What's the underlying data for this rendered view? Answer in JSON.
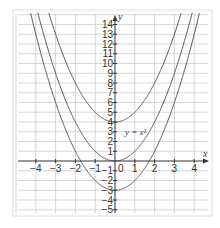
{
  "chart_data": {
    "type": "line",
    "title": "",
    "xlabel": "x",
    "ylabel": "y",
    "xlim": [
      -5,
      4.7
    ],
    "ylim": [
      -5.5,
      15
    ],
    "grid": true,
    "x_ticks": [
      -4,
      -3,
      -2,
      -1,
      0,
      1,
      2,
      3,
      4
    ],
    "y_ticks": [
      -5,
      -4,
      -3,
      -2,
      -1,
      1,
      2,
      3,
      4,
      5,
      6,
      7,
      8,
      9,
      10,
      11,
      12,
      13,
      14
    ],
    "series": [
      {
        "name": "y = x^2 + 4",
        "formula": "x^2 + 4",
        "vertex": [
          0,
          4
        ],
        "label": ""
      },
      {
        "name": "y = x^2",
        "formula": "x^2",
        "vertex": [
          0,
          0
        ],
        "label": "y = x²"
      },
      {
        "name": "y = x^2 - 3",
        "formula": "x^2 - 3",
        "vertex": [
          0,
          -3
        ],
        "label": ""
      }
    ],
    "annotations": [
      {
        "text": "y = x²",
        "x": 0.5,
        "y": 2.7
      }
    ],
    "colors": {
      "curve": "#555555",
      "grid": "#cccccc",
      "axis": "#333333",
      "frame": "#dddddd"
    }
  }
}
